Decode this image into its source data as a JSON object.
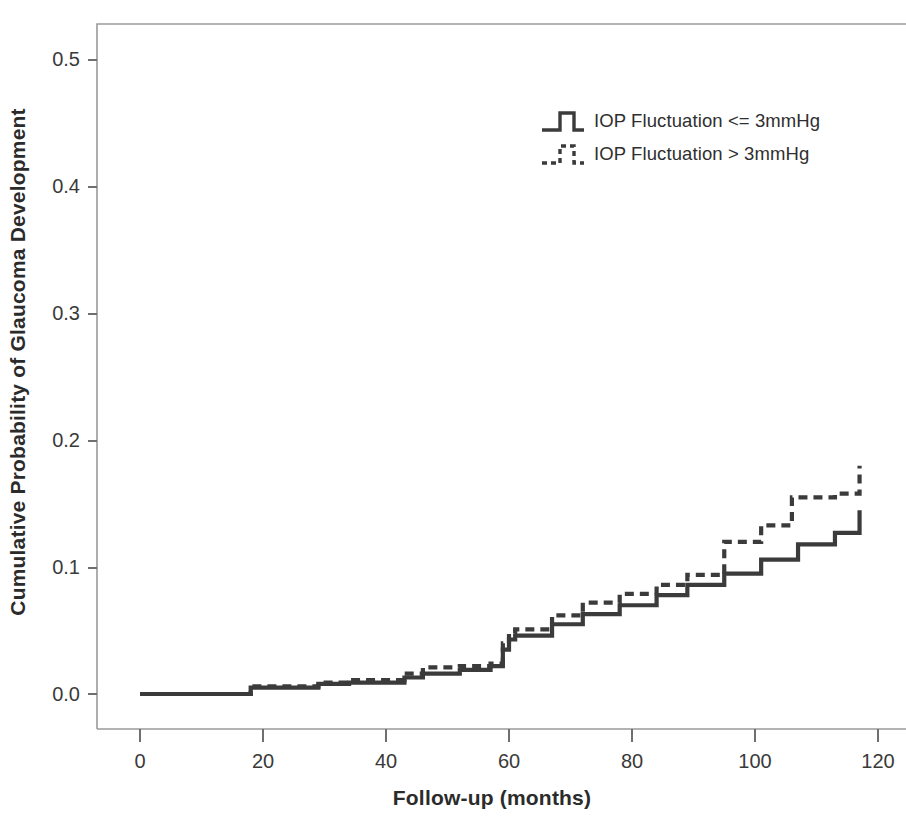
{
  "chart_data": {
    "type": "line",
    "subtype": "kaplan-meier-cumulative-incidence",
    "title": "",
    "xlabel": "Follow-up (months)",
    "ylabel": "Cumulative Probability of Glaucoma Development",
    "xlim": [
      -4,
      128
    ],
    "ylim": [
      -0.018,
      0.525
    ],
    "xticks": [
      0,
      20,
      40,
      60,
      80,
      100,
      120
    ],
    "xtick_labels": [
      "0",
      "20",
      "40",
      "60",
      "80",
      "100",
      "120"
    ],
    "yticks": [
      0.0,
      0.1,
      0.2,
      0.3,
      0.4,
      0.5
    ],
    "ytick_labels": [
      "0.0",
      "0.1",
      "0.2",
      "0.3",
      "0.4",
      "0.5"
    ],
    "grid": false,
    "legend_position": "upper center",
    "line_color": "#3b3b3b",
    "frame_color": "#9a9a9a",
    "series": [
      {
        "name": "IOP Fluctuation <= 3mmHg",
        "style": "solid",
        "x": [
          0,
          17,
          18,
          28,
          29,
          33,
          34,
          42,
          43,
          44,
          46,
          47,
          52,
          53,
          57,
          58,
          59,
          60,
          61,
          66,
          67,
          71,
          72,
          77,
          78,
          83,
          84,
          88,
          89,
          94,
          95,
          100,
          101,
          106,
          107,
          112,
          113,
          117
        ],
        "y": [
          0.0,
          0.0,
          0.005,
          0.005,
          0.008,
          0.008,
          0.009,
          0.009,
          0.013,
          0.013,
          0.016,
          0.016,
          0.019,
          0.019,
          0.022,
          0.022,
          0.035,
          0.043,
          0.046,
          0.046,
          0.055,
          0.055,
          0.063,
          0.063,
          0.07,
          0.07,
          0.078,
          0.078,
          0.086,
          0.086,
          0.095,
          0.095,
          0.106,
          0.106,
          0.118,
          0.118,
          0.127,
          0.145
        ]
      },
      {
        "name": "IOP Fluctuation > 3mmHg",
        "style": "dashed",
        "x": [
          0,
          17,
          18,
          28,
          29,
          33,
          34,
          42,
          43,
          44,
          46,
          47,
          52,
          53,
          57,
          58,
          59,
          60,
          61,
          66,
          67,
          71,
          72,
          77,
          78,
          83,
          84,
          88,
          89,
          94,
          95,
          100,
          101,
          105,
          106,
          112,
          113,
          117
        ],
        "y": [
          0.0,
          0.0,
          0.006,
          0.006,
          0.009,
          0.009,
          0.011,
          0.011,
          0.016,
          0.016,
          0.021,
          0.021,
          0.022,
          0.022,
          0.024,
          0.024,
          0.04,
          0.048,
          0.051,
          0.051,
          0.062,
          0.062,
          0.072,
          0.072,
          0.079,
          0.079,
          0.086,
          0.086,
          0.094,
          0.094,
          0.12,
          0.12,
          0.133,
          0.133,
          0.155,
          0.155,
          0.158,
          0.18
        ]
      }
    ],
    "legend": [
      {
        "label": "IOP Fluctuation <= 3mmHg",
        "style": "solid"
      },
      {
        "label": "IOP Fluctuation > 3mmHg",
        "style": "dashed"
      }
    ]
  }
}
